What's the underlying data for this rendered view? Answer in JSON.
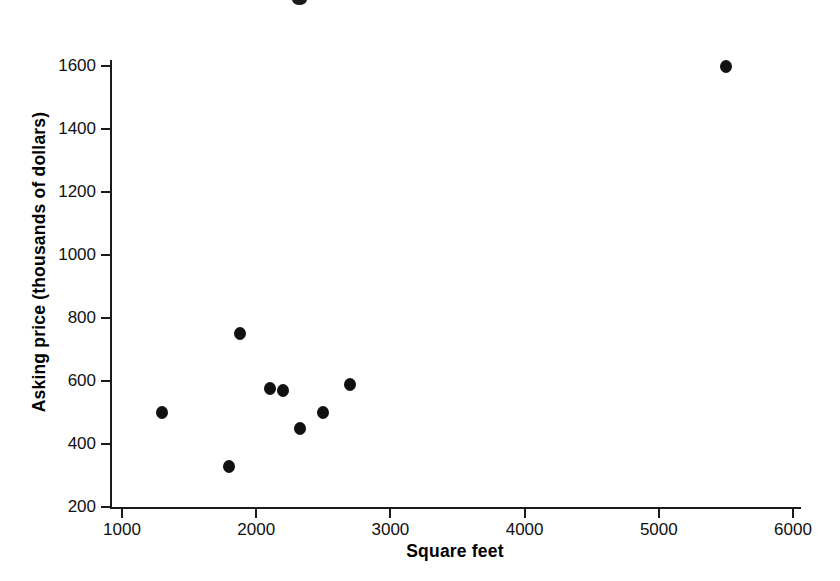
{
  "chart_data": {
    "type": "scatter",
    "title": "",
    "xlabel": "Square feet",
    "ylabel": "Asking price (thousands of dollars)",
    "xlim": [
      800,
      6100
    ],
    "ylim": [
      200,
      1680
    ],
    "xticks": [
      1000,
      2000,
      3000,
      4000,
      5000,
      6000
    ],
    "yticks": [
      200,
      400,
      600,
      800,
      1000,
      1200,
      1400,
      1600
    ],
    "xtick_labels": [
      "1000",
      "2000",
      "3000",
      "4000",
      "5000",
      "6000"
    ],
    "ytick_labels": [
      "200",
      "400",
      "600",
      "800",
      "1000",
      "1200",
      "1400",
      "1600"
    ],
    "grid": false,
    "legend": null,
    "marker": {
      "shape": "circle",
      "color": "#111111",
      "size_px": 12
    },
    "x": [
      1300,
      1800,
      1880,
      2100,
      2200,
      2330,
      2500,
      2700,
      5500
    ],
    "y": [
      500,
      330,
      750,
      575,
      570,
      450,
      500,
      590,
      1600
    ],
    "points": [
      {
        "x": 1300,
        "y": 500
      },
      {
        "x": 1800,
        "y": 330
      },
      {
        "x": 1880,
        "y": 750
      },
      {
        "x": 2100,
        "y": 575
      },
      {
        "x": 2200,
        "y": 570
      },
      {
        "x": 2330,
        "y": 450
      },
      {
        "x": 2500,
        "y": 500
      },
      {
        "x": 2700,
        "y": 590
      },
      {
        "x": 5500,
        "y": 1600
      }
    ],
    "n_points": 9
  },
  "figure": {
    "background_color": "#ffffff",
    "axis_color": "#1b1b1b"
  }
}
